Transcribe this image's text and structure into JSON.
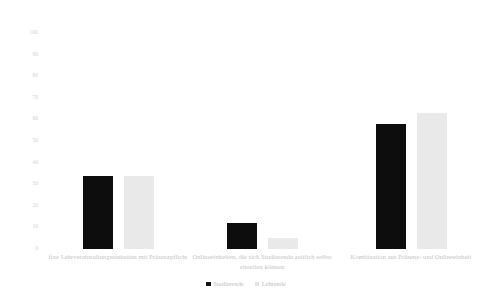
{
  "chart_data": {
    "type": "bar",
    "title": "",
    "subtitle": "",
    "xlabel": "",
    "ylabel": "",
    "ylim": [
      0,
      100
    ],
    "yticks": [
      0,
      10,
      20,
      30,
      40,
      50,
      60,
      70,
      80,
      90,
      100
    ],
    "ytick_labels": [
      "0",
      "10",
      "20",
      "30",
      "40",
      "50",
      "60",
      "70",
      "80",
      "90",
      "100"
    ],
    "grid": false,
    "legend_position": "bottom",
    "categories": [
      "fixe Lehrveranstaltungseinheiten mit Präsenzpflicht",
      "Onlineeinheiten, die sich Studierende zeitlich selbst einteilen können",
      "Kombination aus Präsenz- und Onlineeinheit"
    ],
    "series": [
      {
        "name": "Studierende",
        "color": "#0d0d0d",
        "values": [
          34,
          12,
          58
        ]
      },
      {
        "name": "Lehrende",
        "color": "#e9e9e9",
        "values": [
          34,
          5,
          63
        ]
      }
    ]
  },
  "legend": {
    "items": [
      {
        "label": "Studierende",
        "swatch": "black-square-icon"
      },
      {
        "label": "Lehrende",
        "swatch": "light-gray-square-icon"
      }
    ]
  }
}
